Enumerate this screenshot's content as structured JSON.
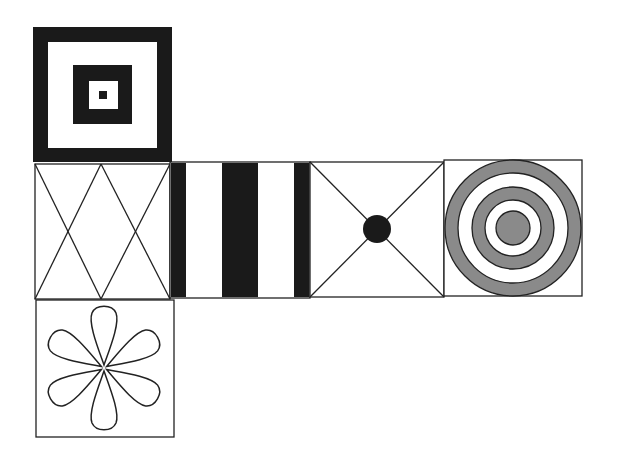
{
  "diagram": {
    "type": "cube-net",
    "colors": {
      "background": "#ffffff",
      "stroke": "#222222",
      "black": "#1a1a1a",
      "gray": "#8a8a8a"
    },
    "faces": [
      {
        "id": "face-top",
        "pattern": "nested-squares",
        "row": 0,
        "col": 0
      },
      {
        "id": "face-left",
        "pattern": "double-x-diamond",
        "row": 1,
        "col": 0
      },
      {
        "id": "face-stripes",
        "pattern": "vertical-stripes",
        "row": 1,
        "col": 1
      },
      {
        "id": "face-x-dot",
        "pattern": "diagonal-x-with-dot",
        "row": 1,
        "col": 2
      },
      {
        "id": "face-target",
        "pattern": "concentric-rings",
        "row": 1,
        "col": 3
      },
      {
        "id": "face-bottom",
        "pattern": "six-petal-flower",
        "row": 2,
        "col": 0
      }
    ]
  }
}
